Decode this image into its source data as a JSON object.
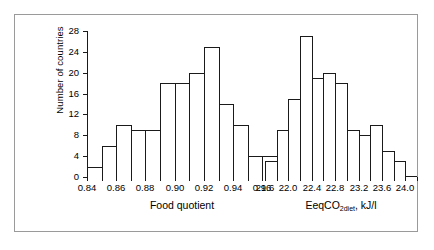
{
  "figure": {
    "ylabel": "Number of countries",
    "y_ticks": [
      "0",
      "4",
      "8",
      "12",
      "16",
      "20",
      "24",
      "28"
    ],
    "frame_color": "#9a9a9a",
    "line_color": "#1a1a1a"
  },
  "chart_data": [
    {
      "type": "bar",
      "title": "",
      "xlabel": "Food quotient",
      "ylabel": "Number of countries",
      "xlim": [
        0.84,
        0.97
      ],
      "ylim": [
        0,
        28
      ],
      "grid": false,
      "legend": "none",
      "bin_width": 0.01,
      "bin_edges": [
        0.84,
        0.85,
        0.86,
        0.87,
        0.88,
        0.89,
        0.9,
        0.91,
        0.92,
        0.93,
        0.94,
        0.95,
        0.96,
        0.97
      ],
      "categories": [
        "0.84-0.85",
        "0.85-0.86",
        "0.86-0.87",
        "0.87-0.88",
        "0.88-0.89",
        "0.89-0.90",
        "0.90-0.91",
        "0.91-0.92",
        "0.92-0.93",
        "0.93-0.94",
        "0.94-0.95",
        "0.95-0.96",
        "0.96-0.97"
      ],
      "values": [
        2,
        6,
        10,
        9,
        9,
        18,
        18,
        20,
        25,
        14,
        10,
        4,
        4
      ],
      "xtick_labels": [
        "0.84",
        "0.86",
        "0.88",
        "0.90",
        "0.92",
        "0.94",
        "0.96"
      ],
      "xtick_values": [
        0.84,
        0.86,
        0.88,
        0.9,
        0.92,
        0.94,
        0.96
      ],
      "ytick_labels": [
        "0",
        "4",
        "8",
        "12",
        "16",
        "20",
        "24",
        "28"
      ],
      "ytick_values": [
        0,
        4,
        8,
        12,
        16,
        20,
        24,
        28
      ]
    },
    {
      "type": "bar",
      "title": "",
      "xlabel_parts": {
        "pre": "EeqCO",
        "sub": "2diet",
        "post": ",  kJ/l"
      },
      "xlabel": "EeqCO2diet,  kJ/l",
      "ylabel": "Number of countries",
      "xlim": [
        21.6,
        24.2
      ],
      "ylim": [
        0,
        28
      ],
      "grid": false,
      "legend": "none",
      "bin_width": 0.2,
      "bin_edges": [
        21.6,
        21.8,
        22.0,
        22.2,
        22.4,
        22.6,
        22.8,
        23.0,
        23.2,
        23.4,
        23.6,
        23.8,
        24.0,
        24.2
      ],
      "categories": [
        "21.6-21.8",
        "21.8-22.0",
        "22.0-22.2",
        "22.2-22.4",
        "22.4-22.6",
        "22.6-22.8",
        "22.8-23.0",
        "23.0-23.2",
        "23.2-23.4",
        "23.4-23.6",
        "23.6-23.8",
        "23.8-24.0"
      ],
      "values": [
        3,
        9,
        15,
        27,
        19,
        20,
        18,
        9,
        8,
        10,
        5,
        3
      ],
      "xtick_labels": [
        "21.6",
        "22.0",
        "22.4",
        "22.8",
        "23.2",
        "23.6",
        "24.0"
      ],
      "xtick_values": [
        21.6,
        22.0,
        22.4,
        22.8,
        23.2,
        23.6,
        24.0
      ],
      "ytick_labels": [
        "0",
        "4",
        "8",
        "12",
        "16",
        "20",
        "24",
        "28"
      ],
      "ytick_values": [
        0,
        4,
        8,
        12,
        16,
        20,
        24,
        28
      ]
    }
  ]
}
